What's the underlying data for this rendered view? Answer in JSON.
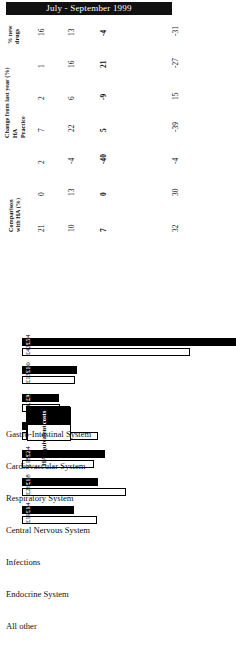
{
  "header": {
    "period_title": "July - September 1999"
  },
  "table": {
    "columns": [
      {
        "id": "new_drugs",
        "label_line1": "% new",
        "label_line2": "drugs"
      },
      {
        "id": "change_group",
        "label": "Change from last year (%)",
        "sub": [
          {
            "id": "ha",
            "label": "HA"
          },
          {
            "id": "practice",
            "label": "Practice"
          }
        ]
      },
      {
        "id": "comparison",
        "label_line1": "Comparison",
        "label_line2": "with HA (%)"
      }
    ],
    "rows": [
      {
        "category": "Gastro-Intestinal System",
        "new_drugs": "16",
        "change_ha": "13",
        "change_practice": "-4",
        "comparison": "-31",
        "practice_cost": "£13,207",
        "ha_equivalent": "£19,054",
        "practice_value": 13207,
        "ha_value": 19054
      },
      {
        "category": "Cardiovascular System",
        "new_drugs": "1",
        "change_ha": "16",
        "change_practice": "21",
        "comparison": "-27",
        "practice_cost": "£19,217",
        "ha_equivalent": "£26,488",
        "practice_value": 19217,
        "ha_value": 26488
      },
      {
        "category": "Respiratory System",
        "new_drugs": "2",
        "change_ha": "6",
        "change_practice": "-9",
        "comparison": "15",
        "practice_cost": "£21,142",
        "ha_equivalent": "£18,354",
        "practice_value": 21142,
        "ha_value": 18354
      },
      {
        "category": "Central Nervous System",
        "new_drugs": "7",
        "change_ha": "22",
        "change_practice": "5",
        "comparison": "-39",
        "practice_cost": "£11,839",
        "ha_equivalent": "£19,290",
        "practice_value": 11839,
        "ha_value": 19290
      },
      {
        "category": "Infections",
        "new_drugs": "2",
        "change_ha": "-4",
        "change_practice": "-40",
        "comparison": "-4",
        "practice_cost": "£9,352",
        "ha_equivalent": "£9,742",
        "practice_value": 9352,
        "ha_value": 9742
      },
      {
        "category": "Endocrine System",
        "new_drugs": "0",
        "change_ha": "13",
        "change_practice": "0",
        "comparison": "30",
        "practice_cost": "£14,023",
        "ha_equivalent": "£13,500",
        "practice_value": 14023,
        "ha_value": 13500
      },
      {
        "category": "All other",
        "new_drugs": "21",
        "change_ha": "10",
        "change_practice": "7",
        "comparison": "32",
        "practice_cost": "£56,388",
        "ha_equivalent": "£42,794",
        "practice_value": 56388,
        "ha_value": 42794
      }
    ]
  },
  "legend": {
    "practice_costs": "Practice costs",
    "ha_equivalent": "HA equivalent"
  },
  "chart_data": {
    "type": "bar",
    "title": "July - September 1999",
    "xlabel": "",
    "ylabel": "",
    "orientation": "vertical",
    "categories": [
      "Gastro-Intestinal System",
      "Cardiovascular System",
      "Respiratory System",
      "Central Nervous System",
      "Infections",
      "Endocrine System",
      "All other"
    ],
    "series": [
      {
        "name": "Practice costs",
        "color": "#000000",
        "values": [
          13207,
          19217,
          21142,
          11839,
          9352,
          14023,
          56388
        ],
        "labels": [
          "£13,207",
          "£19,217",
          "£21,142",
          "£11,839",
          "£9,352",
          "£14,023",
          "£56,388"
        ]
      },
      {
        "name": "HA equivalent",
        "color": "#ffffff",
        "values": [
          19054,
          26488,
          18354,
          19290,
          9742,
          13500,
          42794
        ],
        "labels": [
          "£19,054",
          "£26,488",
          "£18,354",
          "£19,290",
          "£9,742",
          "£13,500",
          "£42,794"
        ]
      }
    ],
    "ylim": [
      0,
      60000
    ],
    "grid": false,
    "legend_position": "top-left"
  },
  "colors": {
    "title_bg": "#111111",
    "title_fg": "#ffffff",
    "practice": "#000000",
    "ha": "#ffffff",
    "outline": "#000000"
  }
}
